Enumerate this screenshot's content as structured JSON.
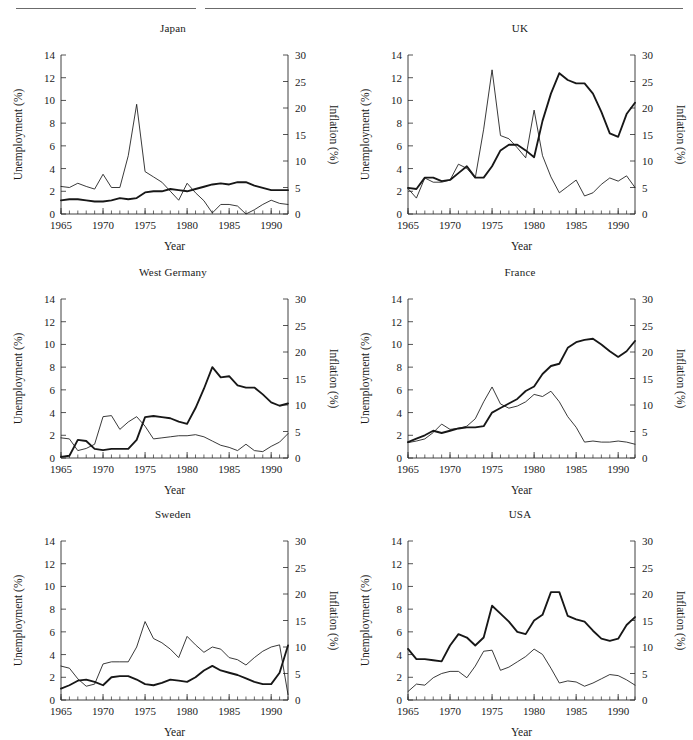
{
  "figure": {
    "header_rules": 2,
    "layout": "2 columns x 3 rows",
    "line_color": "#171717"
  },
  "axes_common": {
    "xlabel": "Year",
    "left_ylabel": "Unemployment (%)",
    "right_ylabel": "Inflation (%)",
    "xlim": [
      1965,
      1992
    ],
    "left_ylim": [
      0,
      14
    ],
    "right_ylim": [
      0,
      30
    ],
    "left_yticks": [
      "0",
      "2",
      "4",
      "6",
      "8",
      "10",
      "12",
      "14"
    ],
    "right_yticks": [
      "0",
      "5",
      "10",
      "15",
      "20",
      "25",
      "30"
    ],
    "xticks": [
      "1965",
      "1970",
      "1975",
      "1980",
      "1985",
      "1990"
    ],
    "grid": false,
    "legend": "none"
  },
  "chart_data": [
    {
      "type": "line",
      "title": "Japan",
      "xlabel": "Year",
      "ylabel": "Unemployment (%)",
      "y2label": "Inflation (%)",
      "xlim": [
        1965,
        1992
      ],
      "ylim": [
        0,
        14
      ],
      "y2lim": [
        0,
        30
      ],
      "x": [
        1965,
        1966,
        1967,
        1968,
        1969,
        1970,
        1971,
        1972,
        1973,
        1974,
        1975,
        1976,
        1977,
        1978,
        1979,
        1980,
        1981,
        1982,
        1983,
        1984,
        1985,
        1986,
        1987,
        1988,
        1989,
        1990,
        1991,
        1992
      ],
      "series": [
        {
          "name": "Unemployment",
          "axis": "left",
          "style": "thick",
          "values": [
            1.2,
            1.3,
            1.3,
            1.2,
            1.1,
            1.1,
            1.2,
            1.4,
            1.3,
            1.4,
            1.9,
            2.0,
            2.0,
            2.2,
            2.1,
            2.0,
            2.2,
            2.4,
            2.6,
            2.7,
            2.6,
            2.8,
            2.8,
            2.5,
            2.3,
            2.1,
            2.1,
            2.1
          ]
        },
        {
          "name": "Inflation",
          "axis": "right",
          "style": "thin",
          "values": [
            5.2,
            5.0,
            5.8,
            5.2,
            4.7,
            7.5,
            5.0,
            5.0,
            11.0,
            20.7,
            8.0,
            7.0,
            6.0,
            4.3,
            2.6,
            5.8,
            4.0,
            2.5,
            0.2,
            1.8,
            1.8,
            1.5,
            0.0,
            0.8,
            1.8,
            2.6,
            2.0,
            1.8
          ]
        }
      ]
    },
    {
      "type": "line",
      "title": "UK",
      "xlabel": "Year",
      "ylabel": "Unemployment (%)",
      "y2label": "Inflation (%)",
      "xlim": [
        1965,
        1992
      ],
      "ylim": [
        0,
        14
      ],
      "y2lim": [
        0,
        30
      ],
      "x": [
        1965,
        1966,
        1967,
        1968,
        1969,
        1970,
        1971,
        1972,
        1973,
        1974,
        1975,
        1976,
        1977,
        1978,
        1979,
        1980,
        1981,
        1982,
        1983,
        1984,
        1985,
        1986,
        1987,
        1988,
        1989,
        1990,
        1991,
        1992
      ],
      "series": [
        {
          "name": "Unemployment",
          "axis": "left",
          "style": "thick",
          "values": [
            2.3,
            2.2,
            3.2,
            3.2,
            2.9,
            3.0,
            3.6,
            4.2,
            3.2,
            3.2,
            4.2,
            5.6,
            6.1,
            6.1,
            5.6,
            5.0,
            8.2,
            10.6,
            12.4,
            11.8,
            11.5,
            11.5,
            10.6,
            9.0,
            7.1,
            6.8,
            8.8,
            9.8
          ]
        },
        {
          "name": "Inflation",
          "axis": "right",
          "style": "thin",
          "values": [
            4.8,
            3.0,
            6.8,
            6.0,
            6.0,
            6.4,
            9.4,
            8.6,
            6.8,
            16.0,
            27.2,
            14.8,
            14.2,
            12.5,
            10.6,
            19.6,
            11.0,
            7.0,
            4.0,
            5.2,
            6.4,
            3.4,
            4.0,
            5.6,
            6.8,
            6.2,
            7.2,
            5.0
          ]
        }
      ]
    },
    {
      "type": "line",
      "title": "West Germany",
      "xlabel": "Year",
      "ylabel": "Unemployment (%)",
      "y2label": "Inflation (%)",
      "xlim": [
        1965,
        1992
      ],
      "ylim": [
        0,
        14
      ],
      "y2lim": [
        0,
        30
      ],
      "x": [
        1965,
        1966,
        1967,
        1968,
        1969,
        1970,
        1971,
        1972,
        1973,
        1974,
        1975,
        1976,
        1977,
        1978,
        1979,
        1980,
        1981,
        1982,
        1983,
        1984,
        1985,
        1986,
        1987,
        1988,
        1989,
        1990,
        1991,
        1992
      ],
      "series": [
        {
          "name": "Unemployment",
          "axis": "left",
          "style": "thick",
          "values": [
            0.1,
            0.2,
            1.6,
            1.5,
            0.8,
            0.7,
            0.8,
            0.8,
            0.8,
            1.6,
            3.6,
            3.7,
            3.6,
            3.5,
            3.2,
            3.0,
            4.4,
            6.1,
            8.0,
            7.1,
            7.2,
            6.4,
            6.2,
            6.2,
            5.6,
            4.9,
            4.6,
            4.8
          ]
        },
        {
          "name": "Inflation",
          "axis": "right",
          "style": "thin",
          "values": [
            3.8,
            3.6,
            1.4,
            1.8,
            2.6,
            7.8,
            8.0,
            5.4,
            6.8,
            7.8,
            6.0,
            3.6,
            3.8,
            4.0,
            4.2,
            4.2,
            4.4,
            4.0,
            3.2,
            2.4,
            2.0,
            1.4,
            2.6,
            1.4,
            1.2,
            2.2,
            3.0,
            4.6
          ]
        }
      ]
    },
    {
      "type": "line",
      "title": "France",
      "xlabel": "Year",
      "ylabel": "Unemployment (%)",
      "y2label": "Inflation (%)",
      "xlim": [
        1965,
        1992
      ],
      "ylim": [
        0,
        14
      ],
      "y2lim": [
        0,
        30
      ],
      "x": [
        1965,
        1966,
        1967,
        1968,
        1969,
        1970,
        1971,
        1972,
        1973,
        1974,
        1975,
        1976,
        1977,
        1978,
        1979,
        1980,
        1981,
        1982,
        1983,
        1984,
        1985,
        1986,
        1987,
        1988,
        1989,
        1990,
        1991,
        1992
      ],
      "series": [
        {
          "name": "Unemployment",
          "axis": "left",
          "style": "thick",
          "values": [
            1.4,
            1.7,
            2.0,
            2.4,
            2.2,
            2.4,
            2.6,
            2.7,
            2.7,
            2.8,
            4.0,
            4.4,
            4.8,
            5.2,
            5.9,
            6.3,
            7.4,
            8.1,
            8.3,
            9.7,
            10.2,
            10.4,
            10.5,
            10.0,
            9.4,
            8.9,
            9.4,
            10.3
          ]
        },
        {
          "name": "Inflation",
          "axis": "right",
          "style": "thin",
          "values": [
            2.9,
            3.2,
            3.6,
            4.8,
            6.4,
            5.4,
            5.6,
            6.0,
            7.4,
            10.6,
            13.4,
            10.2,
            9.4,
            9.8,
            10.6,
            12.0,
            11.6,
            12.6,
            10.6,
            7.8,
            5.8,
            3.0,
            3.2,
            3.0,
            3.0,
            3.2,
            3.0,
            2.6
          ]
        }
      ]
    },
    {
      "type": "line",
      "title": "Sweden",
      "xlabel": "Year",
      "ylabel": "Unemployment (%)",
      "y2label": "Inflation (%)",
      "xlim": [
        1965,
        1992
      ],
      "ylim": [
        0,
        14
      ],
      "y2lim": [
        0,
        30
      ],
      "x": [
        1965,
        1966,
        1967,
        1968,
        1969,
        1970,
        1971,
        1972,
        1973,
        1974,
        1975,
        1976,
        1977,
        1978,
        1979,
        1980,
        1981,
        1982,
        1983,
        1984,
        1985,
        1986,
        1987,
        1988,
        1989,
        1990,
        1991,
        1992
      ],
      "series": [
        {
          "name": "Unemployment",
          "axis": "left",
          "style": "thick",
          "values": [
            1.0,
            1.3,
            1.7,
            1.8,
            1.6,
            1.3,
            2.0,
            2.1,
            2.1,
            1.8,
            1.4,
            1.3,
            1.5,
            1.8,
            1.7,
            1.6,
            2.0,
            2.6,
            3.0,
            2.6,
            2.4,
            2.2,
            1.9,
            1.6,
            1.4,
            1.4,
            2.4,
            4.8
          ]
        },
        {
          "name": "Inflation",
          "axis": "right",
          "style": "thin",
          "values": [
            6.4,
            6.0,
            4.0,
            2.6,
            3.0,
            6.8,
            7.2,
            7.2,
            7.2,
            10.0,
            14.8,
            11.6,
            10.8,
            9.6,
            8.0,
            12.0,
            10.4,
            9.0,
            10.0,
            9.6,
            8.0,
            7.6,
            6.6,
            8.0,
            9.2,
            10.0,
            10.4,
            1.0
          ]
        }
      ]
    },
    {
      "type": "line",
      "title": "USA",
      "xlabel": "Year",
      "ylabel": "Unemployment (%)",
      "y2label": "Inflation (%)",
      "xlim": [
        1965,
        1992
      ],
      "ylim": [
        0,
        14
      ],
      "y2lim": [
        0,
        30
      ],
      "x": [
        1965,
        1966,
        1967,
        1968,
        1969,
        1970,
        1971,
        1972,
        1973,
        1974,
        1975,
        1976,
        1977,
        1978,
        1979,
        1980,
        1981,
        1982,
        1983,
        1984,
        1985,
        1986,
        1987,
        1988,
        1989,
        1990,
        1991,
        1992
      ],
      "series": [
        {
          "name": "Unemployment",
          "axis": "left",
          "style": "thick",
          "values": [
            4.5,
            3.6,
            3.6,
            3.5,
            3.4,
            4.8,
            5.8,
            5.5,
            4.8,
            5.5,
            8.3,
            7.6,
            6.9,
            6.0,
            5.8,
            7.0,
            7.5,
            9.5,
            9.5,
            7.4,
            7.1,
            6.9,
            6.1,
            5.4,
            5.2,
            5.4,
            6.6,
            7.3
          ]
        },
        {
          "name": "Inflation",
          "axis": "right",
          "style": "thin",
          "values": [
            1.6,
            3.0,
            2.8,
            4.2,
            5.0,
            5.4,
            5.4,
            4.2,
            6.4,
            9.2,
            9.4,
            5.6,
            6.2,
            7.2,
            8.2,
            9.6,
            8.6,
            6.0,
            3.2,
            3.6,
            3.4,
            2.6,
            3.2,
            4.0,
            4.8,
            4.6,
            3.8,
            2.8
          ]
        }
      ]
    }
  ]
}
